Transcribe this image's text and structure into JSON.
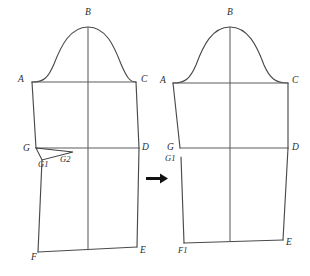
{
  "figure": {
    "background_color": "#ffffff",
    "line_color": "#4a4a4a",
    "label_color": "#2b2b2b",
    "arrow_color": "#111111"
  },
  "left_figure": {
    "name": "sleeve-before",
    "labels": {
      "B": "B",
      "A": "A",
      "C": "C",
      "G": "G",
      "G1": "G1",
      "G2": "G2",
      "D": "D",
      "F": "F",
      "E": "E"
    }
  },
  "right_figure": {
    "name": "sleeve-after",
    "labels": {
      "B": "B",
      "A": "A",
      "C": "C",
      "G": "G",
      "G1": "G1",
      "D": "D",
      "F1": "F1",
      "E": "E"
    }
  },
  "arrow": {
    "direction": "right",
    "glyph": "arrow-right-icon"
  }
}
